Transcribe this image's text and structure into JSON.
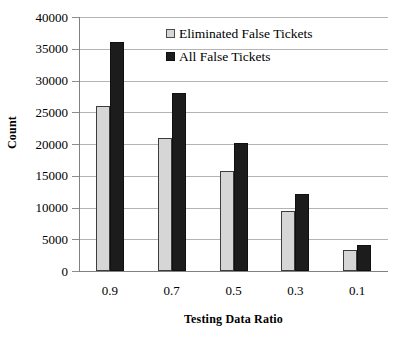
{
  "figure": {
    "cropped_title_remnant": "",
    "background_color": "#ffffff"
  },
  "chart_data": {
    "type": "bar",
    "title": "",
    "xlabel": "Testing Data Ratio",
    "ylabel": "Count",
    "categories": [
      "0.9",
      "0.7",
      "0.5",
      "0.3",
      "0.1"
    ],
    "series": [
      {
        "name": "Eliminated False Tickets",
        "color": "#d6d6d6",
        "edge_color": "#3d3d3d",
        "values": [
          26000,
          21000,
          15700,
          9400,
          3300
        ]
      },
      {
        "name": "All False Tickets",
        "color": "#1c1c1c",
        "edge_color": "#101010",
        "values": [
          36000,
          28000,
          20100,
          12100,
          4100
        ]
      }
    ],
    "ylim": [
      0,
      40000
    ],
    "ytick_labels": [
      "40000",
      "35000",
      "30000",
      "25000",
      "20000",
      "15000",
      "10000",
      "5000",
      "0"
    ],
    "ytick_values": [
      40000,
      35000,
      30000,
      25000,
      20000,
      15000,
      10000,
      5000,
      0
    ],
    "grid": true,
    "grid_axis": "y",
    "grid_color": "#b3b3b3",
    "legend_position": "upper-center-right-inside"
  },
  "legend": {
    "entries": [
      {
        "label": "Eliminated False Tickets"
      },
      {
        "label": "All False Tickets"
      }
    ]
  }
}
